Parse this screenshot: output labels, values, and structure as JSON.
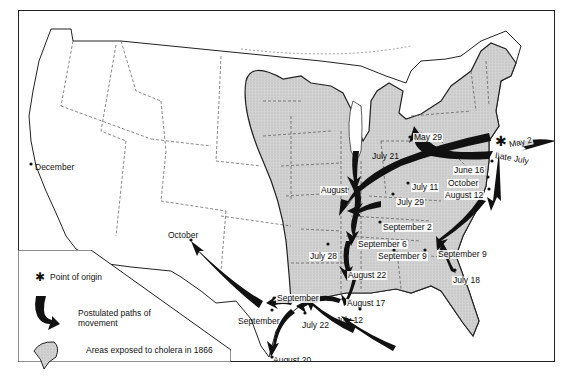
{
  "map": {
    "subject": "Spread of cholera in the United States, 1866",
    "colors": {
      "exposed_area_fill": "#cfcfcf",
      "exposed_area_outline": "#222222",
      "arrow_fill": "#111111",
      "state_border": "#555555",
      "background": "#ffffff"
    },
    "labels": {
      "december": "December",
      "october_west": "October",
      "may_29": "May 29",
      "may_2": "May 2",
      "late_july": "Late July",
      "july_21": "July 21",
      "june_16": "June 16",
      "october_east": "October",
      "august_12": "August 12",
      "july_11": "July 11",
      "august_north": "August",
      "july_29": "July 29",
      "september_2": "September 2",
      "september_6": "September 6",
      "september_9_inland": "September 9",
      "september_9_coast": "September 9",
      "july_28": "July 28",
      "july_18": "July 18",
      "august_22": "August 22",
      "september_tx_upper": "September",
      "september_tx_lower": "September",
      "august_17": "August 17",
      "july_22": "July 22",
      "july_12": "July 12",
      "august_20": "August 20"
    }
  },
  "legend": {
    "items": [
      {
        "icon": "asterisk-icon",
        "label": "Point of origin"
      },
      {
        "icon": "arrow-path-icon",
        "label": "Postulated paths of movement"
      },
      {
        "icon": "shaded-area-icon",
        "label": "Areas exposed to cholera in 1866"
      }
    ],
    "line1": "Postulated paths of",
    "line2": "movement"
  }
}
